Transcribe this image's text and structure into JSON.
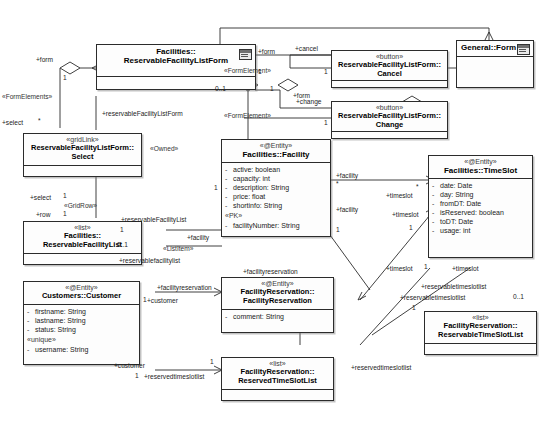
{
  "diagram": {
    "type": "uml-class-diagram"
  },
  "classes": {
    "reservable_facility_list_form": {
      "stereotype": "",
      "name_line1": "Facilities::",
      "name_line2": "ReservableFacilityListForm",
      "icon": "form-icon"
    },
    "general_form": {
      "stereotype": "",
      "name_line1": "General::Form",
      "icon": "form-icon"
    },
    "cancel_button": {
      "stereotype": "«button»",
      "name_line1": "ReservableFacilityListForm::",
      "name_line2": "Cancel"
    },
    "change_button": {
      "stereotype": "«button»",
      "name_line1": "ReservableFacilityListForm::",
      "name_line2": "Change"
    },
    "select_gridlink": {
      "stereotype": "«gridLink»",
      "name_line1": "ReservableFacilityListForm::",
      "name_line2": "Select"
    },
    "reservable_facility_list": {
      "stereotype": "«list»",
      "name_line1": "Facilities::",
      "name_line2": "ReservableFacilityList"
    },
    "facility": {
      "stereotype": "«@Entity»",
      "name_line1": "Facilities::Facility",
      "attributes": [
        {
          "vis": "-",
          "text": "active:  boolean"
        },
        {
          "vis": "-",
          "text": "capacity:  int"
        },
        {
          "vis": "-",
          "text": "description:  String"
        },
        {
          "vis": "-",
          "text": "price:  float"
        },
        {
          "vis": "-",
          "text": "shortinfo:  String"
        }
      ],
      "group_label": "«PK»",
      "group_attributes": [
        {
          "vis": "-",
          "text": "facilityNumber:  String"
        }
      ]
    },
    "time_slot": {
      "stereotype": "«@Entity»",
      "name_line1": "Facilities::TimeSlot",
      "attributes": [
        {
          "vis": "-",
          "text": "date:  Date"
        },
        {
          "vis": "-",
          "text": "day:  String"
        },
        {
          "vis": "-",
          "text": "fromDT:  Date"
        },
        {
          "vis": "-",
          "text": "isReserved:  boolean"
        },
        {
          "vis": "-",
          "text": "toDT:  Date"
        },
        {
          "vis": "-",
          "text": "usage:  int"
        }
      ]
    },
    "customer": {
      "stereotype": "«@Entity»",
      "name_line1": "Customers::Customer",
      "attributes": [
        {
          "vis": "-",
          "text": "firstname:  String"
        },
        {
          "vis": "-",
          "text": "lastname:  String"
        },
        {
          "vis": "-",
          "text": "status:  String"
        }
      ],
      "group_label": "«unique»",
      "group_attributes": [
        {
          "vis": "-",
          "text": "username:  String"
        }
      ]
    },
    "facility_reservation": {
      "stereotype": "«@Entity»",
      "name_line1": "FacilityReservation::",
      "name_line2": "FacilityReservation",
      "attributes": [
        {
          "vis": "-",
          "text": "comment:  String"
        }
      ]
    },
    "reserved_time_slot_list": {
      "stereotype": "«list»",
      "name_line1": "FacilityReservation::",
      "name_line2": "ReservedTimeSlotList"
    },
    "reservable_time_slot_list": {
      "stereotype": "«list»",
      "name_line1": "FacilityReservation::",
      "name_line2": "ReservableTimeSlotList"
    }
  },
  "edge_labels": [
    {
      "id": "l01",
      "text": "+form"
    },
    {
      "id": "l02",
      "text": "+form"
    },
    {
      "id": "l03",
      "text": "«FormElement»"
    },
    {
      "id": "l04",
      "text": "+cancel"
    },
    {
      "id": "l05",
      "text": "+change"
    },
    {
      "id": "l06",
      "text": "«FormElement»"
    },
    {
      "id": "l07",
      "text": "«FormElements»"
    },
    {
      "id": "l08",
      "text": "+select"
    },
    {
      "id": "l09",
      "text": "+form"
    },
    {
      "id": "l10",
      "text": "+reservableFacilityListForm"
    },
    {
      "id": "l11",
      "text": "«Owned»"
    },
    {
      "id": "l12",
      "text": "+select"
    },
    {
      "id": "l13",
      "text": "«GridRow»"
    },
    {
      "id": "l14",
      "text": "+row"
    },
    {
      "id": "l15",
      "text": "+reservableFacilityList"
    },
    {
      "id": "l16",
      "text": "«ListItem»"
    },
    {
      "id": "l17",
      "text": "+reservablefacilitylist"
    },
    {
      "id": "l18",
      "text": "+facility"
    },
    {
      "id": "l19",
      "text": "+facility"
    },
    {
      "id": "l20",
      "text": "+facility"
    },
    {
      "id": "l21",
      "text": "+timeslot"
    },
    {
      "id": "l22",
      "text": "+timeslot"
    },
    {
      "id": "l23",
      "text": "+timeslot"
    },
    {
      "id": "l24",
      "text": "+timeslot"
    },
    {
      "id": "l25",
      "text": "+facilityreservation"
    },
    {
      "id": "l26",
      "text": "+facilityreservation"
    },
    {
      "id": "l27",
      "text": "+customer"
    },
    {
      "id": "l28",
      "text": "+customer"
    },
    {
      "id": "l29",
      "text": "+reservabletimeslotlist"
    },
    {
      "id": "l30",
      "text": "+reservabletimeslotlist"
    },
    {
      "id": "l31",
      "text": "+reservedtimeslotlist"
    },
    {
      "id": "l32",
      "text": "+reservedtimeslotlist"
    }
  ],
  "multiplicities": [
    {
      "id": "m01",
      "text": "1"
    },
    {
      "id": "m02",
      "text": "1"
    },
    {
      "id": "m03",
      "text": "0..1"
    },
    {
      "id": "m04",
      "text": "1"
    },
    {
      "id": "m05",
      "text": "1"
    },
    {
      "id": "m06",
      "text": "1"
    },
    {
      "id": "m07",
      "text": "*"
    },
    {
      "id": "m08",
      "text": "1"
    },
    {
      "id": "m09",
      "text": "1"
    },
    {
      "id": "m10",
      "text": "1"
    },
    {
      "id": "m11",
      "text": "0..1"
    },
    {
      "id": "m12",
      "text": "1"
    },
    {
      "id": "m13",
      "text": "*"
    },
    {
      "id": "m14",
      "text": "1"
    },
    {
      "id": "m15",
      "text": "1"
    },
    {
      "id": "m16",
      "text": "*"
    },
    {
      "id": "m17",
      "text": "1"
    },
    {
      "id": "m18",
      "text": "0..1"
    },
    {
      "id": "m19",
      "text": "1"
    },
    {
      "id": "m20",
      "text": "1"
    },
    {
      "id": "m21",
      "text": "1"
    },
    {
      "id": "m22",
      "text": "1"
    }
  ]
}
